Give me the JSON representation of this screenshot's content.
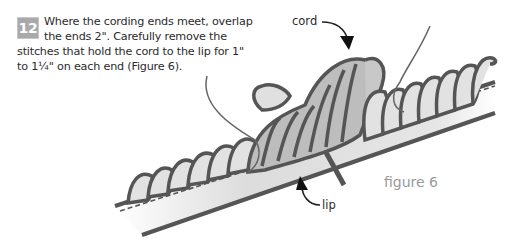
{
  "step": {
    "number": "12",
    "text": "Where the cording ends meet, overlap the ends 2\". Carefully remove the stitches that hold the cord to the lip for 1\" to 1¼\" on each end (Figure 6)."
  },
  "labels": {
    "cord": "cord",
    "lip": "lip",
    "figure": "figure 6"
  },
  "colors": {
    "outline": "#555555",
    "cord_fill": "#b8b8b8",
    "lip_fill": "#e4e4e4",
    "badge": "#a9a9a9"
  }
}
